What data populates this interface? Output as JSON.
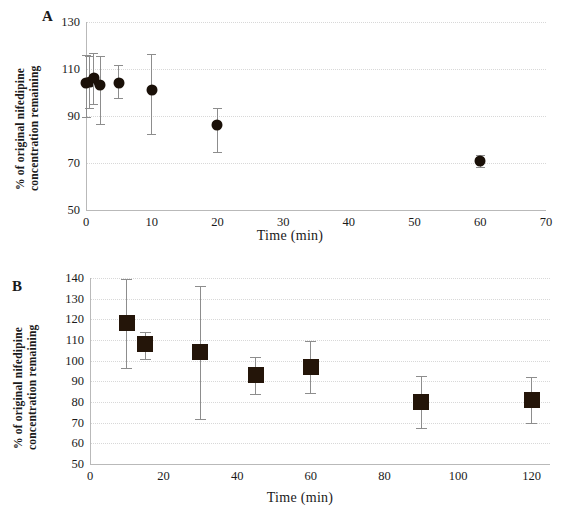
{
  "figure": {
    "panel_a_letter": "A",
    "panel_b_letter": "B",
    "ylabel": "% of original nifedipine\nconcentration remaining",
    "xlabel": "Time (min)",
    "marker_color": "#1a1008",
    "errorbar_color": "#8d8d8d",
    "axis_color": "#b9b9b9"
  },
  "chart_data": [
    {
      "panel": "A",
      "type": "scatter",
      "title": "A",
      "xlabel": "Time (min)",
      "ylabel": "% of original nifedipine concentration remaining",
      "xlim": [
        0,
        70
      ],
      "ylim": [
        50,
        130
      ],
      "xticks": [
        0,
        10,
        20,
        30,
        40,
        50,
        60,
        70
      ],
      "yticks": [
        50,
        70,
        90,
        110,
        130
      ],
      "grid": true,
      "legend": "none",
      "marker": "circle",
      "x": [
        0,
        0.6,
        1.2,
        2.2,
        5,
        10,
        20,
        60
      ],
      "y": [
        104,
        104.5,
        106,
        103,
        104,
        101,
        86,
        71
      ],
      "yerr_low": [
        14.5,
        11,
        11,
        16.5,
        6.5,
        18.5,
        11.5,
        2.5
      ],
      "yerr_high": [
        12,
        11,
        11,
        12.5,
        7.5,
        15.5,
        7.5,
        2.5
      ]
    },
    {
      "panel": "B",
      "type": "scatter",
      "title": "B",
      "xlabel": "Time (min)",
      "ylabel": "% of original nifedipine concentration remaining",
      "xlim": [
        0,
        125
      ],
      "ylim": [
        50,
        140
      ],
      "xticks": [
        0,
        20,
        40,
        60,
        80,
        100,
        120
      ],
      "yticks": [
        50,
        60,
        70,
        80,
        90,
        100,
        110,
        120,
        130,
        140
      ],
      "grid": true,
      "legend": "none",
      "marker": "square",
      "x": [
        10,
        15,
        30,
        45,
        60,
        90,
        120
      ],
      "y": [
        118,
        108,
        104,
        93,
        97,
        80,
        81
      ],
      "yerr_low": [
        21.5,
        7,
        32,
        9,
        12.5,
        12.5,
        11
      ],
      "yerr_high": [
        21.5,
        6,
        32,
        9,
        12.5,
        12.5,
        11
      ]
    }
  ]
}
